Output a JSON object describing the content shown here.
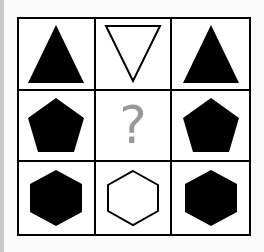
{
  "puzzle": {
    "cells": [
      {
        "shape": "triangle-up",
        "fill": "black"
      },
      {
        "shape": "triangle-down",
        "fill": "white"
      },
      {
        "shape": "triangle-up",
        "fill": "black"
      },
      {
        "shape": "pentagon",
        "fill": "black"
      },
      {
        "shape": "unknown",
        "label": "?"
      },
      {
        "shape": "pentagon",
        "fill": "black"
      },
      {
        "shape": "hexagon",
        "fill": "black"
      },
      {
        "shape": "hexagon",
        "fill": "white"
      },
      {
        "shape": "hexagon",
        "fill": "black"
      }
    ],
    "question_mark": "?"
  }
}
